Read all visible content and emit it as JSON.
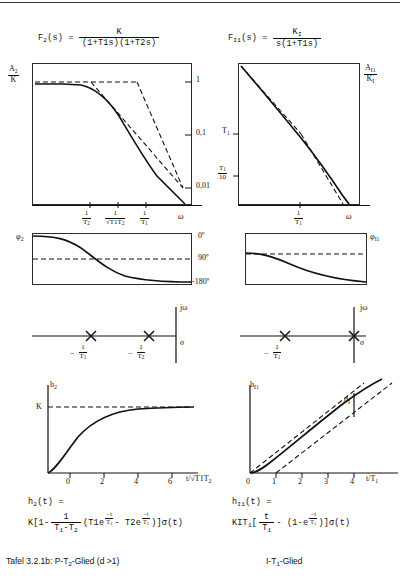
{
  "caption": {
    "left": "Tafel 3.2.1b:  P-T2-Glied (d >1)",
    "right": "I-T1-Glied"
  },
  "left_column": {
    "transfer_function": {
      "lhs": "F2(s)  =",
      "numerator": "K",
      "denominator": "(1+T1s)(1+T2s)"
    },
    "bode_magnitude": {
      "ylabel_top_num": "A2",
      "ylabel_top_den": "K",
      "right_ticks": [
        "1",
        "0,1",
        "0,01"
      ],
      "xaxis_label": "ω",
      "xticks": [
        {
          "num": "1",
          "den": "T2"
        },
        {
          "num": "1",
          "den": "√T1T2"
        },
        {
          "num": "1",
          "den": "T1"
        }
      ]
    },
    "phase": {
      "ylabel": "φ2",
      "ticks": [
        "0º",
        "90º",
        "-180º"
      ]
    },
    "pole_zero": {
      "imag_axis": "jω",
      "real_axis": "σ",
      "poles": [
        {
          "num": "1",
          "den": "T1",
          "sign": "−"
        },
        {
          "num": "1",
          "den": "T2",
          "sign": "−"
        }
      ]
    },
    "step_response": {
      "ylabel": "h2",
      "asymptote_label": "K",
      "xticks": [
        "0",
        "2",
        "4",
        "6"
      ],
      "xaxis_label": "t/√T1T2"
    },
    "time_equation": {
      "line1": "h2(t) =",
      "line2_a": "K[1-",
      "fraction_num": "1",
      "fraction_den": "T1-T2",
      "line2_b": "(T1e",
      "exp1_num": "t",
      "exp1_den": "T1",
      "line2_c": "- T2e",
      "exp2_num": "t",
      "exp2_den": "T2",
      "line2_d": ")]σ(t)"
    }
  },
  "right_column": {
    "transfer_function": {
      "lhs": "FI1(s)  =",
      "numerator": "KI",
      "denominator": "s(1+T1s)"
    },
    "bode_magnitude": {
      "ylabel_right_num": "AI1",
      "ylabel_right_den": "KI",
      "left_ticks": [
        {
          "text": "T1",
          "type": "plain"
        },
        {
          "num": "T1",
          "den": "10",
          "type": "frac"
        }
      ],
      "xaxis_label": "ω",
      "xticks": [
        {
          "num": "1",
          "den": "T1"
        }
      ]
    },
    "phase": {
      "ylabel": "φI1",
      "ticks": [
        "0º",
        "90º",
        "-180º"
      ]
    },
    "pole_zero": {
      "imag_axis": "jω",
      "real_axis": "σ",
      "poles": [
        {
          "num": "1",
          "den": "T1",
          "sign": "−"
        }
      ],
      "origin_pole": true
    },
    "step_response": {
      "ylabel": "hI1",
      "annotation": "dI",
      "xticks": [
        "0",
        "1",
        "2",
        "3",
        "4"
      ],
      "xaxis_label": "t/T1"
    },
    "time_equation": {
      "line1": "hI1(t) =",
      "line2_a": "KIT1[",
      "fraction_num": "t",
      "fraction_den": "T1",
      "line2_b": "-  (1-e",
      "exp1_num": "t",
      "exp1_den": "T1",
      "line2_c": ")]σ(t)"
    }
  },
  "colors": {
    "ink": "#111111",
    "rule": "#2b2b2b"
  }
}
